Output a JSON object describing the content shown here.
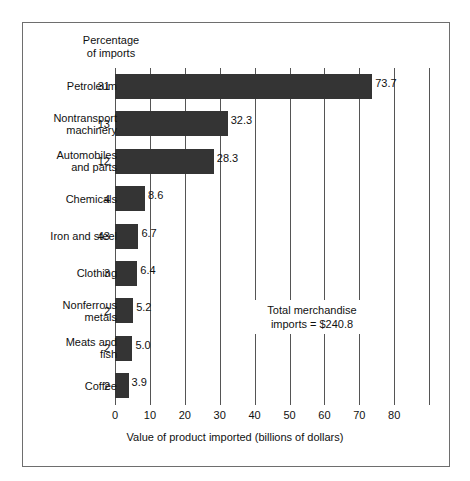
{
  "figure": {
    "percentage_header": "Percentage\nof imports",
    "annotation": "Total merchandise\nimports  =  $240.8",
    "axis_title": "Value of product imported (billions of dollars)",
    "bar_color": "#343434",
    "frame_color": "#6e6e6e",
    "gridline_color": "#555555"
  },
  "chart_data": {
    "type": "bar",
    "orientation": "horizontal",
    "title": "",
    "subtitle": "",
    "xlabel": "Value of product imported (billions of dollars)",
    "ylabel": "",
    "xlim": [
      0,
      90
    ],
    "xticks": [
      0,
      10,
      20,
      30,
      40,
      50,
      60,
      70,
      80
    ],
    "xtick_labels": [
      "0",
      "10",
      "20",
      "30",
      "40",
      "50",
      "60",
      "70",
      "80"
    ],
    "extra_gridlines": [
      90
    ],
    "grid": "vertical-only",
    "legend": "none",
    "value_label_format": "one-decimal",
    "annotations": [
      "Total merchandise  =  $240.8"
    ],
    "series_name": "Value of product imported (billions of dollars)",
    "secondary_series_name": "Percentage of imports",
    "categories": [
      "Petroleum",
      "Nontransport machinery",
      "Automobiles and parts",
      "Chemicals",
      "Iron and steel",
      "Clothing",
      "Nonferrous metals",
      "Meats and fish",
      "Coffee"
    ],
    "values": [
      73.7,
      32.3,
      28.3,
      8.6,
      6.7,
      6.4,
      5.2,
      5.0,
      3.9
    ],
    "percentages": [
      31,
      13,
      12,
      4,
      43,
      3,
      2,
      2,
      2
    ],
    "total_merchandise_imports": 240.8
  },
  "rows": [
    {
      "label": "Petroleum",
      "pct": "31",
      "value": 73.7,
      "value_label": "73.7"
    },
    {
      "label": "Nontransport\nmachinery",
      "pct": "13",
      "value": 32.3,
      "value_label": "32.3"
    },
    {
      "label": "Automobiles\nand parts",
      "pct": "12",
      "value": 28.3,
      "value_label": "28.3"
    },
    {
      "label": "Chemicals",
      "pct": "4",
      "value": 8.6,
      "value_label": "8.6"
    },
    {
      "label": "Iron and steel",
      "pct": "43",
      "value": 6.7,
      "value_label": "6.7"
    },
    {
      "label": "Clothing",
      "pct": "3",
      "value": 6.4,
      "value_label": "6.4"
    },
    {
      "label": "Nonferrous\nmetals",
      "pct": "2",
      "value": 5.2,
      "value_label": "5.2"
    },
    {
      "label": "Meats and\nfish",
      "pct": "2",
      "value": 5.0,
      "value_label": "5.0"
    },
    {
      "label": "Coffee",
      "pct": "2",
      "value": 3.9,
      "value_label": "3.9"
    }
  ],
  "ticks": [
    {
      "value": 0,
      "label": "0"
    },
    {
      "value": 10,
      "label": "10"
    },
    {
      "value": 20,
      "label": "20"
    },
    {
      "value": 30,
      "label": "30"
    },
    {
      "value": 40,
      "label": "40"
    },
    {
      "value": 50,
      "label": "50"
    },
    {
      "value": 60,
      "label": "60"
    },
    {
      "value": 70,
      "label": "70"
    },
    {
      "value": 80,
      "label": "80"
    }
  ],
  "gridlines": [
    0,
    10,
    20,
    30,
    40,
    50,
    60,
    70,
    80,
    90
  ]
}
